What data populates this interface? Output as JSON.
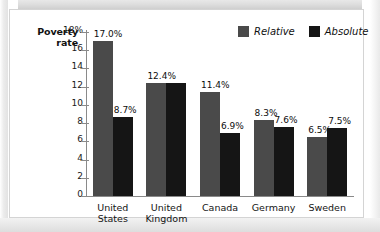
{
  "chart_data": {
    "type": "bar",
    "title": "",
    "ylabel": "Poverty rate",
    "xlabel": "",
    "ylim": [
      0,
      18
    ],
    "grid": false,
    "legend_position": "top-right",
    "ytick_labels": [
      "18%",
      "16",
      "14",
      "12",
      "10",
      "8",
      "6",
      "4",
      "2",
      "0"
    ],
    "ytick_values": [
      18,
      16,
      14,
      12,
      10,
      8,
      6,
      4,
      2,
      0
    ],
    "categories": [
      "United States",
      "United Kingdom",
      "Canada",
      "Germany",
      "Sweden"
    ],
    "category_lines": [
      [
        "United",
        "States"
      ],
      [
        "United",
        "Kingdom"
      ],
      [
        "Canada"
      ],
      [
        "Germany"
      ],
      [
        "Sweden"
      ]
    ],
    "series": [
      {
        "name": "Relative",
        "color": "#4a4a4a",
        "values": [
          17.0,
          12.4,
          11.4,
          8.3,
          6.5
        ],
        "labels": [
          "17.0%",
          "12.4%",
          "11.4%",
          "8.3%",
          "6.5%"
        ]
      },
      {
        "name": "Absolute",
        "color": "#151515",
        "values": [
          8.7,
          12.4,
          6.9,
          7.6,
          7.5
        ],
        "labels": [
          "8.7%",
          "",
          "6.9%",
          "7.6%",
          "7.5%"
        ]
      }
    ]
  },
  "axis_title": {
    "line1": "Poverty",
    "line2": "rate"
  },
  "legend": {
    "items": [
      {
        "label": "Relative",
        "color": "#4a4a4a"
      },
      {
        "label": "Absolute",
        "color": "#151515"
      }
    ]
  }
}
